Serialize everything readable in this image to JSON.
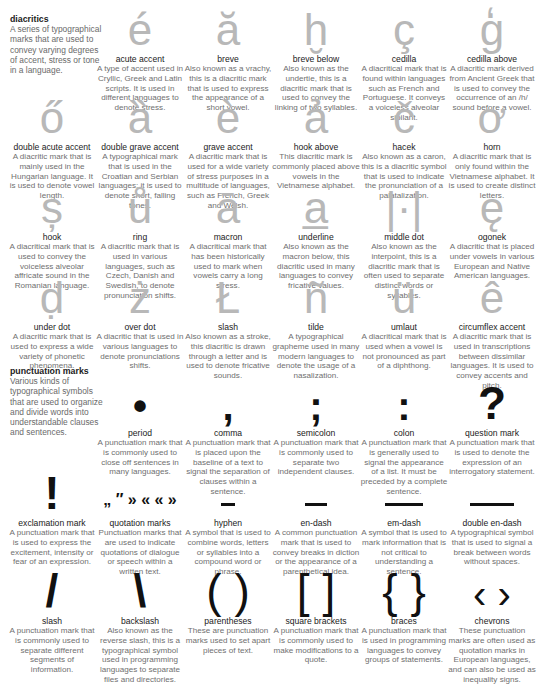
{
  "sections": {
    "diacritics": {
      "title": "diacritics",
      "description": "A series of typographical marks that are used to convey varying degrees of accent, stress or tone in a language.",
      "items": [
        {
          "glyph": "é",
          "name": "acute accent",
          "description": "A type of accent used in Cryllic, Greek and Latin scripts. It is used in different languages to denote stress."
        },
        {
          "glyph": "ă",
          "name": "breve",
          "description": "Also known as a vrachy, this is a diacritic mark that is used to express the appearance of a short vowel."
        },
        {
          "glyph": "ḫ",
          "name": "breve below",
          "description": "Also known as the undertie, this is a diacritic mark that is used to convey the linking of two syllables."
        },
        {
          "glyph": "ç",
          "name": "cedilla",
          "description": "A diacritical mark that is found within languages such as French and Portuguese. It conveys a voiceless alveolar sibilant."
        },
        {
          "glyph": "g̒",
          "name": "cedilla above",
          "description": "A diacritic mark derived from Ancient Greek that is used to convey the occurrence of an /h/ sound before a vowel."
        },
        {
          "glyph": "ő",
          "name": "double acute accent",
          "description": "A diacritic mark that is mainly used in the Hungarian language. It is used to denote vowel length."
        },
        {
          "glyph": "ȁ",
          "name": "double grave accent",
          "description": "A typographical mark that is used in the Croatian and Serbian languages; it is used to denote short, falling tones."
        },
        {
          "glyph": "è",
          "name": "grave accent",
          "description": "A diacritic mark that is used for a wide variety of stress purposes in a multitude of languages, such as French, Greek and Welsh."
        },
        {
          "glyph": "ả",
          "name": "hook above",
          "description": "This diacritic mark is commonly placed above vowels in the Vietnamese alphabet."
        },
        {
          "glyph": "č",
          "name": "hacek",
          "description": "Also known as a caron, this is a diacritic symbol that is used to indicate the pronunciation of a palatalization."
        },
        {
          "glyph": "ơ",
          "name": "horn",
          "description": "A diacritic mark that is only found within the Vietnamese alphabet. It is used to create distinct letters."
        },
        {
          "glyph": "ș",
          "name": "hook",
          "description": "A diacritical mark that is used to convey the voiceless alveolar affricate sound in the Romanian language."
        },
        {
          "glyph": "ů",
          "name": "ring",
          "description": "A diacritic mark that is used in various languages, such as Czech, Danish and Swedish, to denote pronunciation shifts."
        },
        {
          "glyph": "ā",
          "name": "macron",
          "description": "A diacritical mark that has been historically used to mark when vowels carry a long stress."
        },
        {
          "glyph": "a̲",
          "name": "underline",
          "description": "Also known as the macron below, this diacritic used in many languages to convey fricative values."
        },
        {
          "glyph": "|·|",
          "name": "middle dot",
          "description": "Also known as the interpoint, this is a diacritic mark that is often used to separate distinct words or syllables."
        },
        {
          "glyph": "ę",
          "name": "ogonek",
          "description": "A diacritic that is placed under vowels in various European and Native American languages."
        },
        {
          "glyph": "ḍ",
          "name": "under dot",
          "description": "A diacritic mark that is used to express a wide variety of phonetic phenomena."
        },
        {
          "glyph": "ż",
          "name": "over dot",
          "description": "A diacritic that is used in various languages to denote pronunciations shifts."
        },
        {
          "glyph": "Ł",
          "name": "slash",
          "description": "Also known as a stroke, this diacritic is drawn through a letter and is used to denote fricative sounds."
        },
        {
          "glyph": "ñ",
          "name": "tilde",
          "description": "A typographical grapheme used in many modern languages to denote the usage of a nasalization."
        },
        {
          "glyph": "ü",
          "name": "umlaut",
          "description": "A diacritical mark that is used when a vowel is not pronounced as part of a diphthong."
        },
        {
          "glyph": "ê",
          "name": "circumflex accent",
          "description": "A diacritic mark that is used in transcriptions between dissimilar languages. It is used to convey accents and pitch."
        }
      ]
    },
    "punctuation": {
      "title": "punctuation marks",
      "description": "Various kinds of typographical symbols that are used to organize and divide words into understandable clauses and sentences.",
      "items": [
        {
          "glyph": "•",
          "name": "period",
          "description": "A punctuation mark that is commonly used to close off sentences in many languages."
        },
        {
          "glyph": ",",
          "name": "comma",
          "description": "A punctuation mark that is placed upon the baseline of a text to signal the separation of clauses within a sentence."
        },
        {
          "glyph": ";",
          "name": "semicolon",
          "description": "A punctuation mark that is commonly used to separate two independent clauses."
        },
        {
          "glyph": ":",
          "name": "colon",
          "description": "A punctuation mark that is generally used to signal the appearance of a list. It must be preceded by a complete sentence."
        },
        {
          "glyph": "?",
          "name": "question mark",
          "description": "A punctuation mark that is used to denote the expression of an interrogatory statement."
        },
        {
          "glyph": "!",
          "name": "exclamation mark",
          "description": "A punctuation mark that is used to express the excitement, intensity or fear of an expression."
        },
        {
          "glyph": "„ ″ » « « »",
          "name": "quotation marks",
          "description": "Punctuation marks that are used to indicate quotations of dialogue or speech within a written text."
        },
        {
          "glyph": "-",
          "name": "hyphen",
          "description": "A symbol that is used to combine words, letters or syllables into a compound word or phrase."
        },
        {
          "glyph": "–",
          "name": "en-dash",
          "description": "A common punctuation mark that is used to convey breaks in diction or the appearance of a parenthetical idea."
        },
        {
          "glyph": "—",
          "name": "em-dash",
          "description": "A symbol that is used to mark information that is not critical to understanding a sentence."
        },
        {
          "glyph": "⸺",
          "name": "double en-dash",
          "description": "A typographical symbol that is used to signal a break between words without spaces."
        },
        {
          "glyph": "/",
          "name": "slash",
          "description": "A punctuation mark that is commonly used to separate different segments of information."
        },
        {
          "glyph": "\\",
          "name": "backslash",
          "description": "Also known as the reverse slash, this is a typographical symbol used in programming languages to separate files and directories."
        },
        {
          "glyph": "( )",
          "name": "parentheses",
          "description": "These are punctuation marks used to set apart pieces of text."
        },
        {
          "glyph": "[ ]",
          "name": "square brackets",
          "description": "A punctuation mark that is commonly used to make modifications to a quote."
        },
        {
          "glyph": "{ }",
          "name": "braces",
          "description": "A punctuation mark that is used in programming languages to convey groups of statements."
        },
        {
          "glyph": "‹ ›",
          "name": "chevrons",
          "description": "These punctuation marks are often used as quotation marks in European languages, and can also be used as inequality signs."
        }
      ]
    }
  }
}
